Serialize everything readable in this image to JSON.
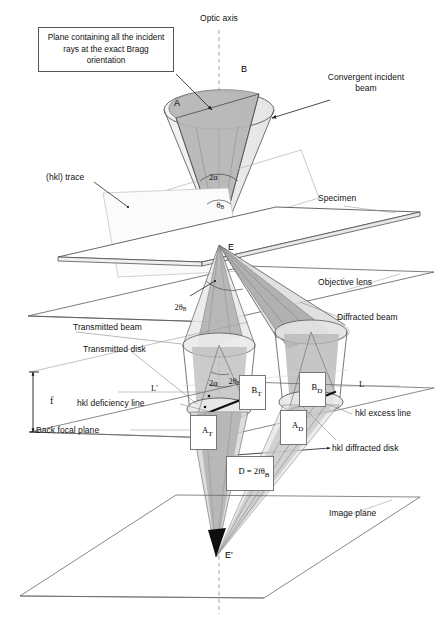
{
  "figure": {
    "background_color": "#ffffff",
    "line_color": "#4a4a4a",
    "shade_color": "#b9b9b9",
    "width": 438,
    "height": 624
  },
  "callouts": {
    "bragg_plane_box": "Plane containing all the\nincident rays at the\nexact Bragg orientation",
    "optic_axis": "Optic axis",
    "convergent_incident_beam": "Convergent incident\nbeam",
    "hkl_trace": "(hkl) trace",
    "specimen": "Specimen",
    "objective_lens": "Objective lens",
    "transmitted_beam": "Transmitted beam",
    "transmitted_disk": "Transmitted disk",
    "diffracted_beam": "Diffracted beam",
    "hkl_deficiency_line": "hkl deficiency line",
    "hkl_excess_line": "hkl excess line",
    "hkl_diffracted_disk": "hkl diffracted disk",
    "back_focal_plane": "Back focal plane",
    "image_plane": "Image plane"
  },
  "point_labels": {
    "a_top": "A",
    "b_top": "B",
    "e_specimen": "E",
    "a_transmitted": "A",
    "a_transmitted_sub": "T",
    "b_transmitted": "B",
    "b_transmitted_sub": "T",
    "a_diffracted": "A",
    "a_diffracted_sub": "D",
    "b_diffracted": "B",
    "b_diffracted_sub": "D",
    "e_prime": "E'"
  },
  "angle_labels": {
    "two_alpha_top": "2α",
    "theta_b_top": "θ",
    "theta_b_top_sub": "B",
    "two_theta_b_lens": "2θ",
    "two_theta_b_lens_sub": "B",
    "two_theta_b_disk": "2θ",
    "two_theta_b_disk_sub": "B",
    "two_alpha_disk": "2α"
  },
  "dimension_labels": {
    "focal_length": "f",
    "excess_distance": "L",
    "deficiency_distance": "L'",
    "disk_diameter": "D = 2fθ",
    "disk_diameter_sub": "B"
  }
}
